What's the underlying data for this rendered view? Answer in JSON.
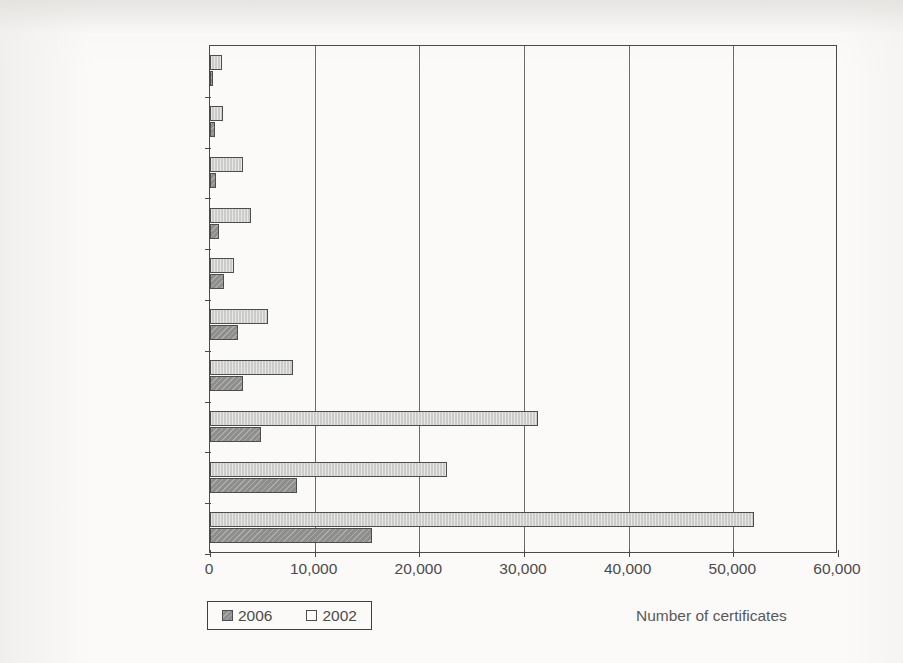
{
  "chart_data": {
    "type": "bar",
    "orientation": "horizontal",
    "title": "",
    "xlabel": "Number of certificates",
    "ylabel": "",
    "xlim": [
      0,
      60000
    ],
    "xticks": [
      0,
      10000,
      20000,
      30000,
      40000,
      50000,
      60000
    ],
    "xtick_labels": [
      "0",
      "10,000",
      "20,000",
      "30,000",
      "40,000",
      "50,000",
      "60,000"
    ],
    "grid": true,
    "legend_position": "bottom-left",
    "categories": [
      "Middle East",
      "Africa",
      "West Asia",
      "C. & S. America/Caribbean",
      "Australasia",
      "Other Europe",
      "NAFTA",
      "Far East (excluding Japan)",
      "Japan",
      "EU"
    ],
    "series": [
      {
        "name": "2006",
        "color": "#8e8e8c",
        "values": [
          300,
          450,
          600,
          900,
          1370,
          2670,
          3150,
          4870,
          8300,
          15500
        ]
      },
      {
        "name": "2002",
        "color": "#cbcbc9",
        "values": [
          1150,
          1240,
          3150,
          3900,
          2300,
          5540,
          7930,
          31330,
          22640,
          51960
        ]
      }
    ]
  },
  "legend": {
    "entries": [
      {
        "label": "2006",
        "swatch": "2006"
      },
      {
        "label": "2002",
        "swatch": "2002"
      }
    ]
  },
  "axis": {
    "x_title": "Number of certificates"
  },
  "caption": {
    "text": ""
  }
}
